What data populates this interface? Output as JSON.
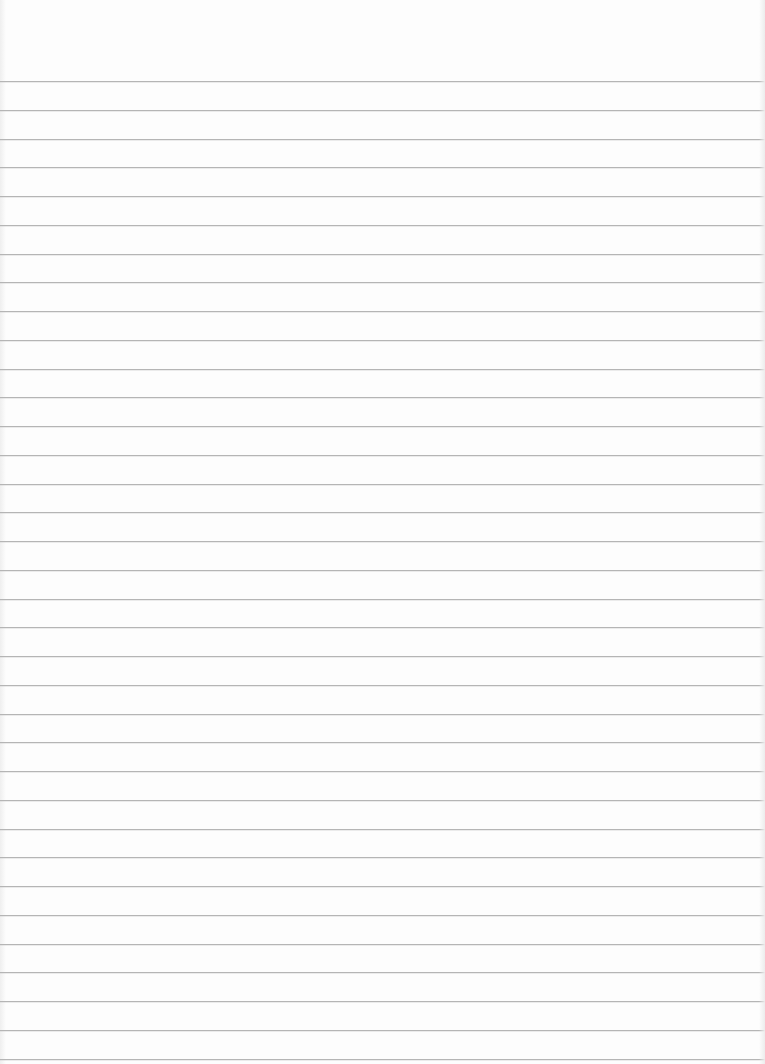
{
  "page": {
    "type": "lined-paper",
    "background_color": "#fdfdfd",
    "line_color": "#b5b5b5",
    "first_line_y": 81,
    "line_spacing": 28.75,
    "line_count": 35
  }
}
